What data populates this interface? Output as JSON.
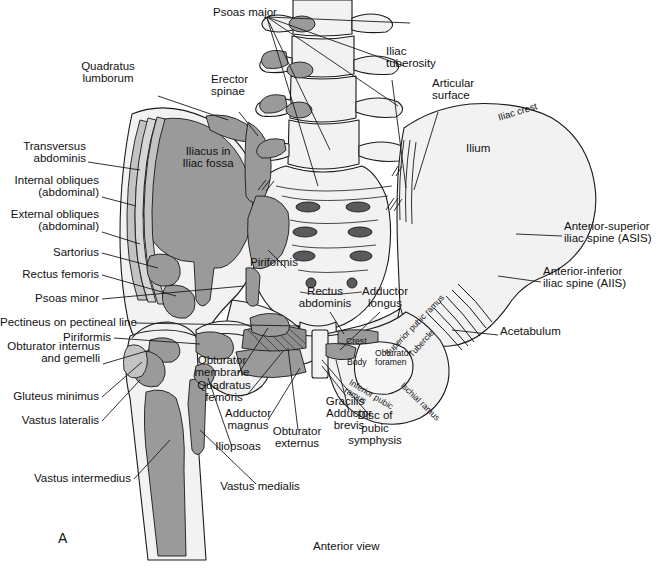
{
  "figure": {
    "panel_letter": "A",
    "caption": "Anterior view",
    "colors": {
      "bone_fill": "#f2f2f2",
      "muscle_gray": "#9a9a9a",
      "muscle_light": "#c3c3c3",
      "outline": "#1a1a1a",
      "page_background": "#ffffff"
    }
  },
  "labels_left": [
    {
      "id": "quadratus-lumborum",
      "text": "Quadratus\nlumborum",
      "x": 108,
      "y": 72,
      "align": "center"
    },
    {
      "id": "transversus-abdominis",
      "text": "Transversus\nabdominis",
      "x": 86,
      "y": 152,
      "align": "right"
    },
    {
      "id": "internal-obliques",
      "text": "Internal obliques\n(abdominal)",
      "x": 99,
      "y": 186,
      "align": "right"
    },
    {
      "id": "external-obliques",
      "text": "External obliques\n(abdominal)",
      "x": 99,
      "y": 220,
      "align": "right"
    },
    {
      "id": "sartorius",
      "text": "Sartorius",
      "x": 99,
      "y": 252,
      "align": "right"
    },
    {
      "id": "rectus-femoris",
      "text": "Rectus femoris",
      "x": 99,
      "y": 274,
      "align": "right"
    },
    {
      "id": "psoas-minor",
      "text": "Psoas minor",
      "x": 99,
      "y": 298,
      "align": "right"
    },
    {
      "id": "pectineus-on-pectineal-line",
      "text": "Pectineus on pectineal line",
      "x": 132,
      "y": 322,
      "align": "right"
    },
    {
      "id": "piriformis-left",
      "text": "Piriformis",
      "x": 111,
      "y": 337,
      "align": "right"
    },
    {
      "id": "obturator-internus-and-gemelli",
      "text": "Obturator internus\nand gemelli",
      "x": 100,
      "y": 352,
      "align": "right"
    },
    {
      "id": "gluteus-minimus",
      "text": "Gluteus minimus",
      "x": 99,
      "y": 396,
      "align": "right"
    },
    {
      "id": "vastus-lateralis",
      "text": "Vastus lateralis",
      "x": 99,
      "y": 420,
      "align": "right"
    },
    {
      "id": "vastus-intermedius",
      "text": "Vastus intermedius",
      "x": 131,
      "y": 478,
      "align": "right"
    }
  ],
  "labels_top": [
    {
      "id": "psoas-major",
      "text": "Psoas major",
      "x": 213,
      "y": 12,
      "align": "left"
    },
    {
      "id": "erector-spinae",
      "text": "Erector\nspinae",
      "x": 211,
      "y": 85,
      "align": "left"
    },
    {
      "id": "iliac-tuberosity",
      "text": "Iliac\ntuberosity",
      "x": 386,
      "y": 57,
      "align": "left"
    },
    {
      "id": "articular-surface",
      "text": "Articular\nsurface",
      "x": 432,
      "y": 89,
      "align": "left"
    }
  ],
  "labels_right": [
    {
      "id": "ilium",
      "text": "Ilium",
      "x": 466,
      "y": 148,
      "align": "left"
    },
    {
      "id": "anterior-superior-iliac-spine",
      "text": "Anterior-superior\niliac spine (ASIS)",
      "x": 564,
      "y": 232,
      "align": "left"
    },
    {
      "id": "anterior-inferior-iliac-spine",
      "text": "Anterior-inferior\niliac spine (AIIS)",
      "x": 543,
      "y": 277,
      "align": "left"
    },
    {
      "id": "acetabulum",
      "text": "Acetabulum",
      "x": 500,
      "y": 331,
      "align": "left"
    }
  ],
  "labels_center": [
    {
      "id": "iliacus-in-iliac-fossa",
      "text": "Iliacus in\nIliac fossa",
      "x": 208,
      "y": 157,
      "align": "center"
    },
    {
      "id": "piriformis-center",
      "text": "Piriformis",
      "x": 250,
      "y": 262,
      "align": "left"
    },
    {
      "id": "rectus-abdominis",
      "text": "Rectus\nabdominis",
      "x": 325,
      "y": 297,
      "align": "center"
    },
    {
      "id": "adductor-longus",
      "text": "Adductor\nlongus",
      "x": 385,
      "y": 297,
      "align": "center"
    },
    {
      "id": "obturator-membrane",
      "text": "Obturator\nmembrane",
      "x": 222,
      "y": 366,
      "align": "center"
    },
    {
      "id": "quadratus-femoris",
      "text": "Quadratus\nfemoris",
      "x": 224,
      "y": 391,
      "align": "center"
    },
    {
      "id": "adductor-magnus",
      "text": "Adductor\nmagnus",
      "x": 248,
      "y": 419,
      "align": "center"
    },
    {
      "id": "iliopsoas",
      "text": "Iliopsoas",
      "x": 238,
      "y": 446,
      "align": "center"
    },
    {
      "id": "vastus-medialis",
      "text": "Vastus medialis",
      "x": 260,
      "y": 486,
      "align": "center"
    },
    {
      "id": "obturator-externus",
      "text": "Obturator\nexternus",
      "x": 297,
      "y": 437,
      "align": "center"
    },
    {
      "id": "adductor-brevis",
      "text": "Adductor\nbrevis",
      "x": 349,
      "y": 419,
      "align": "center"
    },
    {
      "id": "gracilis",
      "text": "Gracilis",
      "x": 345,
      "y": 401,
      "align": "center"
    },
    {
      "id": "disc-of-pubic-symphysis",
      "text": "Disc of\npubic\nsymphysis",
      "x": 375,
      "y": 428,
      "align": "center"
    }
  ],
  "labels_inline_bone": [
    {
      "id": "iliac-crest",
      "text": "Iliac crest",
      "x": 497,
      "y": 113,
      "rotate": -17,
      "size": "small"
    },
    {
      "id": "superior-pubic-ramus",
      "text": "Superior pubic ramus",
      "x": 383,
      "y": 352,
      "rotate": -46,
      "size": "tiny"
    },
    {
      "id": "tubercle",
      "text": "Tubercle",
      "x": 407,
      "y": 353,
      "rotate": -48,
      "size": "tiny"
    },
    {
      "id": "crest",
      "text": "Crest",
      "x": 346,
      "y": 342,
      "rotate": 0,
      "size": "tiny"
    },
    {
      "id": "body",
      "text": "Body",
      "x": 347,
      "y": 363,
      "rotate": 0,
      "size": "tiny"
    },
    {
      "id": "obturator-foramen",
      "text": "Obturator\nforamen",
      "x": 375,
      "y": 358,
      "rotate": 0,
      "size": "tiny"
    },
    {
      "id": "inferior-pubic-ramus",
      "text": "Inferior pubic\nramus",
      "x": 352,
      "y": 378,
      "rotate": 31,
      "size": "tiny"
    },
    {
      "id": "ischial-ramus",
      "text": "Ischial ramus",
      "x": 405,
      "y": 381,
      "rotate": 44,
      "size": "tiny"
    }
  ],
  "leaders": {
    "psoas_major_fan_origin": {
      "x": 267,
      "y": 17
    },
    "psoas_major_targets": [
      {
        "x": 410,
        "y": 24
      },
      {
        "x": 408,
        "y": 70
      },
      {
        "x": 405,
        "y": 108
      },
      {
        "x": 330,
        "y": 152
      },
      {
        "x": 318,
        "y": 185
      }
    ]
  }
}
